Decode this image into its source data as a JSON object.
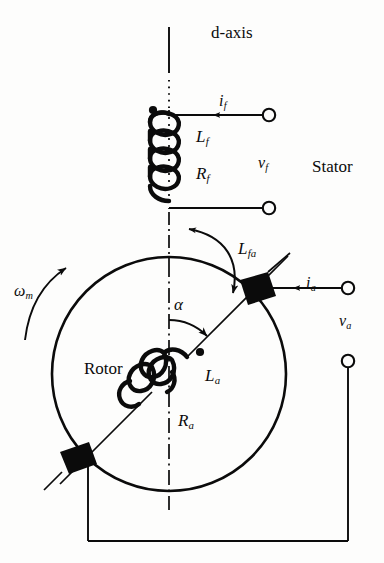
{
  "figure": {
    "background_color": "#fdfdfc",
    "line_color": "#0b0b0b",
    "width": 384,
    "height": 563
  },
  "labels": {
    "d_axis": "d-axis",
    "stator": "Stator",
    "rotor": "Rotor",
    "field_current": "i",
    "field_current_sub": "f",
    "field_voltage": "v",
    "field_voltage_sub": "f",
    "field_inductance": "L",
    "field_inductance_sub": "f",
    "field_resistance": "R",
    "field_resistance_sub": "f",
    "mutual_inductance": "L",
    "mutual_inductance_sub": "fa",
    "angle": "α",
    "speed": "ω",
    "speed_sub": "m",
    "armature_current": "i",
    "armature_current_sub": "a",
    "armature_voltage": "v",
    "armature_voltage_sub": "a",
    "armature_inductance": "L",
    "armature_inductance_sub": "a",
    "armature_resistance": "R",
    "armature_resistance_sub": "a"
  },
  "geometry": {
    "rotor_circle": {
      "cx": 169,
      "cy": 374,
      "r": 117
    },
    "d_axis_x": 169,
    "field_terminal_top": {
      "x": 270,
      "y": 118
    },
    "field_terminal_bottom": {
      "x": 270,
      "y": 208
    },
    "armature_terminal_top": {
      "x": 348,
      "y": 286
    },
    "armature_terminal_bottom": {
      "x": 348,
      "y": 360
    },
    "brush_top_right": {
      "x": 255,
      "y": 290
    },
    "brush_bottom_left": {
      "x": 83,
      "y": 458
    },
    "armature_axis_angle_deg": 45,
    "alpha_angle_deg": 45
  },
  "icons": {
    "dot_marker": "polarity-dot",
    "terminal": "open-circle-terminal",
    "brush": "filled-parallelogram-brush",
    "coil": "helical-winding"
  }
}
